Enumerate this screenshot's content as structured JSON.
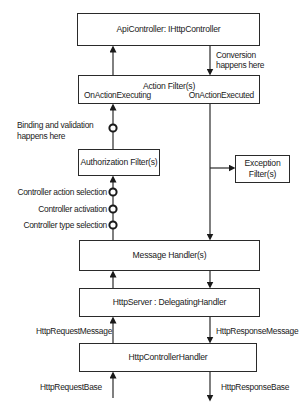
{
  "diagram": {
    "boxes": {
      "api_controller": "ApiController: IHttpController",
      "action_filters": "Action Filter(s)",
      "authorization_filters": "Authorization Filter(s)",
      "exception_filters_line1": "Exception",
      "exception_filters_line2": "Filter(s)",
      "message_handlers": "Message Handler(s)",
      "http_server": "HttpServer : DelegatingHandler",
      "http_controller_handler": "HttpControllerHandler"
    },
    "labels": {
      "conversion_line1": "Conversion",
      "conversion_line2": "happens here",
      "on_action_executing": "OnActionExecuting",
      "on_action_executed": "OnActionExecuted",
      "binding_line1": "Binding and validation",
      "binding_line2": "happens here",
      "controller_action_selection": "Controller action selection",
      "controller_activation": "Controller activation",
      "controller_type_selection": "Controller type selection",
      "http_request_message": "HttpRequestMessage",
      "http_response_message": "HttpResponseMessage",
      "http_request_base": "HttpRequestBase",
      "http_response_base": "HttpResponseBase"
    }
  }
}
